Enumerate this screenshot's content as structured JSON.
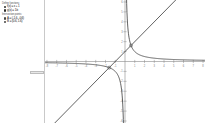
{
  "panel": {
    "groups": [
      {
        "title": "Define functions:",
        "entries": [
          {
            "marker": "bullet",
            "text": "f(x) = x + 1"
          },
          {
            "marker": "bullet",
            "text": "g(x) = 1/x"
          }
        ]
      },
      {
        "title": "Intersection points:",
        "entries": [
          {
            "marker": "point",
            "text": "A = (-1.6, -0.6)"
          },
          {
            "marker": "point",
            "text": "B = (0.6, 1.6)"
          }
        ]
      }
    ],
    "handle_label": ""
  },
  "chart_data": {
    "type": "line",
    "title": "",
    "xlabel": "x",
    "ylabel": "y",
    "xlim": [
      -8.2,
      8.2
    ],
    "ylim": [
      -6.2,
      6.2
    ],
    "grid": false,
    "axis_color": "#8a8a8a",
    "curve_color": "#3a3a3a",
    "xticks": [
      -8,
      -7,
      -6,
      -5,
      -4,
      -3,
      -2,
      -1,
      1,
      2,
      3,
      4,
      5,
      6,
      7,
      8
    ],
    "yticks": [
      -6,
      -5,
      -4,
      -3,
      -2,
      -1,
      1,
      2,
      3,
      4,
      5,
      6
    ],
    "series": [
      {
        "name": "f(x) = x + 1",
        "kind": "line",
        "slope": 1,
        "intercept": 1,
        "color": "#3a3a3a"
      },
      {
        "name": "g(x) = 1/x",
        "kind": "hyperbola",
        "coefficient": 1,
        "asymptote_x": 0,
        "asymptote_y": 0,
        "color": "#3a3a3a"
      }
    ],
    "points": [
      {
        "label": "A",
        "x": -1.618,
        "y": -0.618,
        "marked": true
      },
      {
        "label": "B",
        "x": 0.618,
        "y": 1.618,
        "marked": true
      }
    ]
  }
}
